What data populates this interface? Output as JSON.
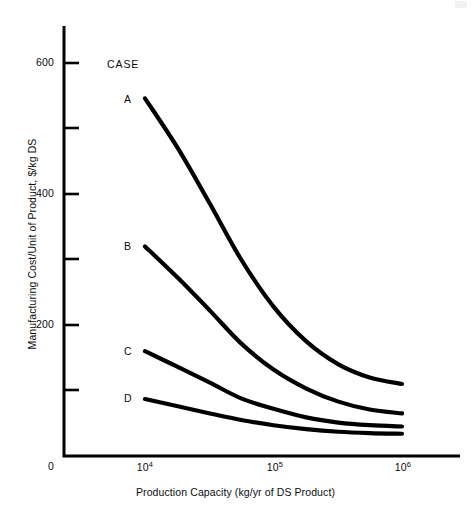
{
  "figure": {
    "legend_heading": "CASE",
    "background_color": "#ffffff",
    "line_color": "#000000"
  },
  "chart_data": {
    "type": "line",
    "title": "",
    "xlabel": "Production Capacity (kg/yr of DS Product)",
    "ylabel": "Manufacturing Cost/Unit of Product, $/kg DS",
    "x_scale": "log",
    "y_scale": "linear",
    "xlim": [
      10000,
      1000000
    ],
    "ylim": [
      0,
      660
    ],
    "grid": false,
    "legend_position": "inline-left-of-curve-start",
    "x_tick_labels": [
      "10⁴",
      "10⁵",
      "10⁶"
    ],
    "x_tick_values": [
      10000,
      100000,
      1000000
    ],
    "y_tick_labels": [
      "0",
      "200",
      "400",
      "600"
    ],
    "y_tick_values": [
      0,
      200,
      400,
      600
    ],
    "y_minor_tick_values": [
      100,
      300,
      500
    ],
    "series": [
      {
        "name": "A",
        "label": "A",
        "points": [
          {
            "x": 10000,
            "y": 546
          },
          {
            "x": 18000,
            "y": 470
          },
          {
            "x": 32000,
            "y": 385
          },
          {
            "x": 56000,
            "y": 300
          },
          {
            "x": 100000,
            "y": 228
          },
          {
            "x": 180000,
            "y": 175
          },
          {
            "x": 320000,
            "y": 140
          },
          {
            "x": 560000,
            "y": 120
          },
          {
            "x": 1000000,
            "y": 110
          }
        ]
      },
      {
        "name": "B",
        "label": "B",
        "points": [
          {
            "x": 10000,
            "y": 320
          },
          {
            "x": 18000,
            "y": 272
          },
          {
            "x": 32000,
            "y": 222
          },
          {
            "x": 56000,
            "y": 172
          },
          {
            "x": 100000,
            "y": 132
          },
          {
            "x": 180000,
            "y": 103
          },
          {
            "x": 320000,
            "y": 83
          },
          {
            "x": 560000,
            "y": 71
          },
          {
            "x": 1000000,
            "y": 65
          }
        ]
      },
      {
        "name": "C",
        "label": "C",
        "points": [
          {
            "x": 10000,
            "y": 160
          },
          {
            "x": 18000,
            "y": 136
          },
          {
            "x": 32000,
            "y": 112
          },
          {
            "x": 56000,
            "y": 88
          },
          {
            "x": 100000,
            "y": 72
          },
          {
            "x": 180000,
            "y": 59
          },
          {
            "x": 320000,
            "y": 51
          },
          {
            "x": 560000,
            "y": 47
          },
          {
            "x": 1000000,
            "y": 45
          }
        ]
      },
      {
        "name": "D",
        "label": "D",
        "points": [
          {
            "x": 10000,
            "y": 87
          },
          {
            "x": 18000,
            "y": 76
          },
          {
            "x": 32000,
            "y": 65
          },
          {
            "x": 56000,
            "y": 55
          },
          {
            "x": 100000,
            "y": 47
          },
          {
            "x": 180000,
            "y": 41
          },
          {
            "x": 320000,
            "y": 37
          },
          {
            "x": 560000,
            "y": 35
          },
          {
            "x": 1000000,
            "y": 34
          }
        ]
      }
    ]
  }
}
